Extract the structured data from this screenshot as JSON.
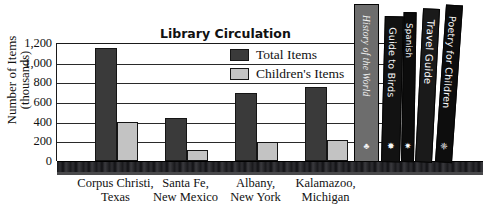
{
  "chart_data": {
    "type": "bar",
    "title": "Library Circulation",
    "xlabel": "",
    "ylabel": "Number of Items (thousands)",
    "ylabel_line1": "Number of Items",
    "ylabel_line2": "(thousands)",
    "ylim": [
      0,
      1200
    ],
    "yticks": [
      "0",
      "200",
      "400",
      "600",
      "800",
      "1,000",
      "1,200"
    ],
    "ytick_values": [
      0,
      200,
      400,
      600,
      800,
      1000,
      1200
    ],
    "grid": true,
    "legend_position": "upper right",
    "categories": [
      "Corpus Christi, Texas",
      "Santa Fe, New Mexico",
      "Albany, New York",
      "Kalamazoo, Michigan"
    ],
    "category_lines": [
      [
        "Corpus Christi,",
        "Texas"
      ],
      [
        "Santa Fe,",
        "New Mexico"
      ],
      [
        "Albany,",
        "New York"
      ],
      [
        "Kalamazoo,",
        "Michigan"
      ]
    ],
    "series": [
      {
        "name": "Total Items",
        "color": "#3a3a3a",
        "values": [
          1150,
          440,
          690,
          755
        ]
      },
      {
        "name": "Children's Items",
        "color": "#c3c3c3",
        "values": [
          400,
          110,
          190,
          210
        ]
      }
    ]
  },
  "books": [
    {
      "title": "History of the World",
      "spine_color": "#6d6d6d",
      "text_color": "#f2f2f2",
      "italic": true,
      "ornament": "♣"
    },
    {
      "title": "Guide to Birds",
      "spine_color": "#121212",
      "text_color": "#f5f5f5",
      "italic": false,
      "ornament": "✸"
    },
    {
      "title": "Spanish",
      "spine_color": "#0c0c0c",
      "text_color": "#ffffff",
      "italic": false,
      "ornament": "✷"
    },
    {
      "title": "Travel Guide",
      "spine_color": "#1a1a1a",
      "text_color": "#ffffff",
      "italic": false,
      "ornament": ""
    },
    {
      "title": "Poetry for Children",
      "spine_color": "#0d0d0d",
      "text_color": "#fafafa",
      "italic": false,
      "ornament": "❈"
    }
  ]
}
